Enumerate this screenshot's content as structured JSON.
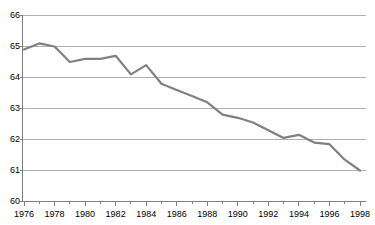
{
  "chart_data": {
    "type": "line",
    "title": "",
    "xlabel": "",
    "ylabel": "",
    "x": [
      1976,
      1977,
      1978,
      1979,
      1980,
      1981,
      1982,
      1983,
      1984,
      1985,
      1986,
      1987,
      1988,
      1989,
      1990,
      1991,
      1992,
      1993,
      1994,
      1995,
      1996,
      1997,
      1998
    ],
    "values": [
      64.9,
      65.1,
      65.0,
      64.5,
      64.6,
      64.6,
      64.7,
      64.1,
      64.4,
      63.8,
      63.6,
      63.4,
      63.2,
      62.8,
      62.7,
      62.55,
      62.3,
      62.05,
      62.15,
      61.9,
      61.85,
      61.35,
      61.0
    ],
    "series": [
      {
        "name": "series-1",
        "color": "#808080",
        "values": [
          64.9,
          65.1,
          65.0,
          64.5,
          64.6,
          64.6,
          64.7,
          64.1,
          64.4,
          63.8,
          63.6,
          63.4,
          63.2,
          62.8,
          62.7,
          62.55,
          62.3,
          62.05,
          62.15,
          61.9,
          61.85,
          61.35,
          61.0
        ]
      }
    ],
    "ylim": [
      60,
      66
    ],
    "xlim": [
      1976,
      1998
    ],
    "yticks": [
      60,
      61,
      62,
      63,
      64,
      65,
      66
    ],
    "ytick_labels": [
      "60",
      "61",
      "62",
      "63",
      "64",
      "65",
      "66"
    ],
    "xticks": [
      1976,
      1978,
      1980,
      1982,
      1984,
      1986,
      1988,
      1990,
      1992,
      1994,
      1996,
      1998
    ],
    "xtick_labels": [
      "1976",
      "1978",
      "1980",
      "1982",
      "1984",
      "1986",
      "1988",
      "1990",
      "1992",
      "1994",
      "1996",
      "1998"
    ],
    "x_minor_ticks": [
      1977,
      1979,
      1981,
      1983,
      1985,
      1987,
      1989,
      1991,
      1993,
      1995,
      1997
    ],
    "grid": "horizontal",
    "legend": "none",
    "gridline_color": "#b0b0b0",
    "axis_color": "#808080",
    "text_color": "#000000",
    "background": "#ffffff"
  },
  "top_artifact": {
    "text": ""
  }
}
